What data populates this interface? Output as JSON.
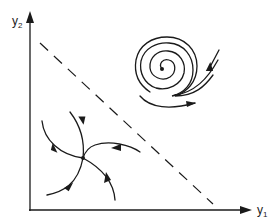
{
  "diagram": {
    "axes": {
      "x_label": "y",
      "x_subscript": "1",
      "y_label": "y",
      "y_subscript": "2"
    },
    "elements": [
      {
        "name": "stable-node",
        "description": "trajectories converging to a single point (sink)"
      },
      {
        "name": "unstable-spiral",
        "description": "spiral trajectory emanating outward from a center point"
      },
      {
        "name": "separatrix",
        "description": "dashed diagonal line separating the two regions"
      }
    ],
    "colors": {
      "ink": "#1a1a1a",
      "background": "#ffffff"
    }
  }
}
